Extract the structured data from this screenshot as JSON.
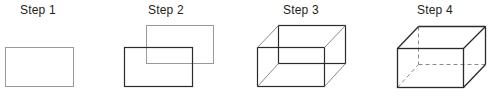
{
  "steps": [
    {
      "label": "Step 1",
      "description": "Draw a rectangle (front face)"
    },
    {
      "label": "Step 2",
      "description": "Draw a second offset rectangle (back face)"
    },
    {
      "label": "Step 3",
      "description": "Connect corresponding corners"
    },
    {
      "label": "Step 4",
      "description": "Darken visible edges, dash hidden edges"
    }
  ],
  "colors": {
    "guide": "#9a9a9a",
    "line": "#2a2a2a",
    "hidden": "#8a8a8a"
  }
}
